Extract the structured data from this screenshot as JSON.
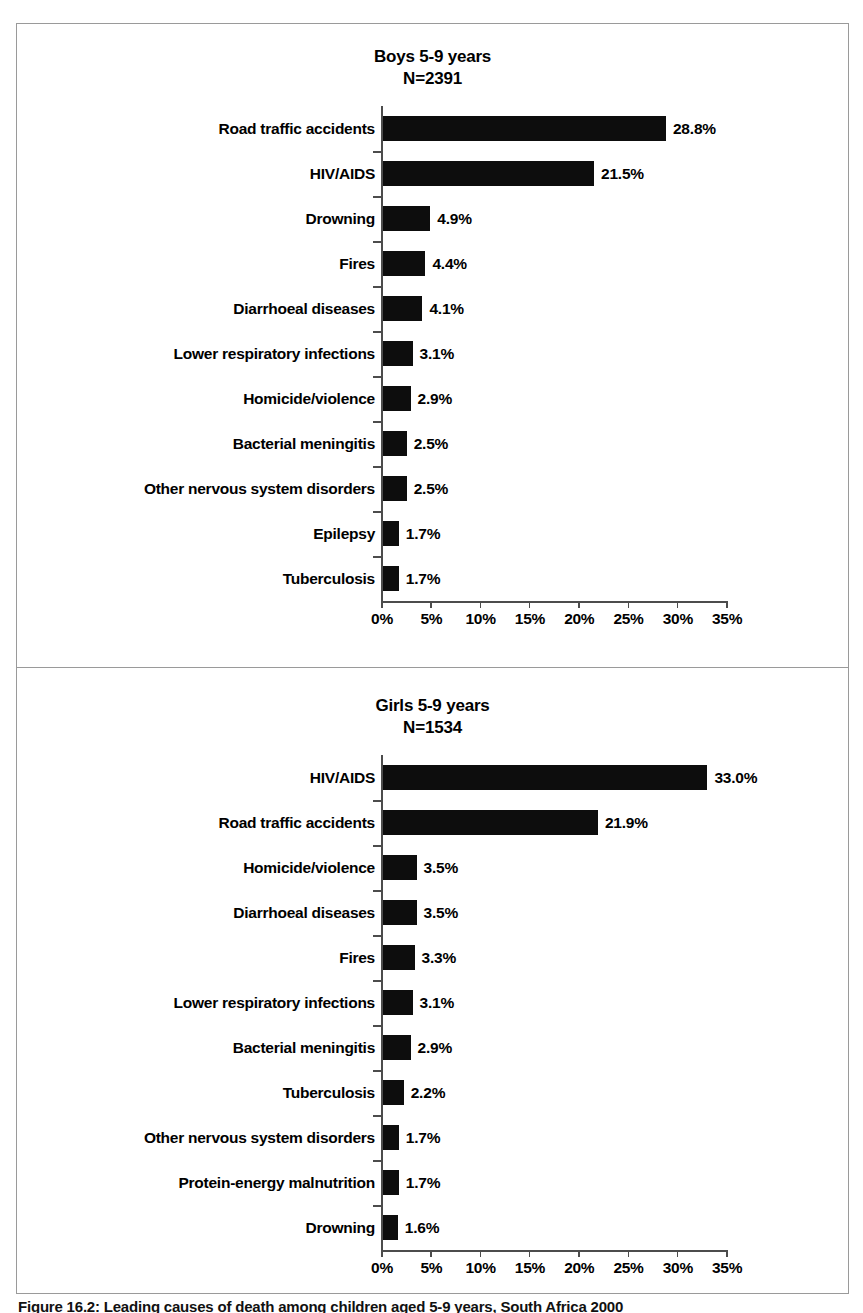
{
  "figure": {
    "caption": "Figure 16.2: Leading causes of death among children aged 5-9 years, South Africa 2000"
  },
  "panels": [
    {
      "id": "boys",
      "title": "Boys 5-9 years",
      "sample_size": "N=2391"
    },
    {
      "id": "girls",
      "title": "Girls 5-9 years",
      "sample_size": "N=1534"
    }
  ],
  "axis": {
    "ticks": [
      "0%",
      "5%",
      "10%",
      "15%",
      "20%",
      "25%",
      "30%",
      "35%"
    ]
  },
  "chart_data": [
    {
      "type": "bar",
      "orientation": "horizontal",
      "title": "Boys 5-9 years",
      "subtitle": "N=2391",
      "xlabel": "",
      "ylabel": "",
      "xlim": [
        0,
        35
      ],
      "xtick_labels": [
        "0%",
        "5%",
        "10%",
        "15%",
        "20%",
        "25%",
        "30%",
        "35%"
      ],
      "xticks": [
        0,
        5,
        10,
        15,
        20,
        25,
        30,
        35
      ],
      "grid": false,
      "legend": "none",
      "bar_color": "#0d0d0d",
      "categories": [
        "Road traffic accidents",
        "HIV/AIDS",
        "Drowning",
        "Fires",
        "Diarrhoeal diseases",
        "Lower respiratory infections",
        "Homicide/violence",
        "Bacterial meningitis",
        "Other nervous system disorders",
        "Epilepsy",
        "Tuberculosis"
      ],
      "values": [
        28.8,
        21.5,
        4.9,
        4.4,
        4.1,
        3.1,
        2.9,
        2.5,
        2.5,
        1.7,
        1.7
      ],
      "data_labels": [
        "28.8%",
        "21.5%",
        "4.9%",
        "4.4%",
        "4.1%",
        "3.1%",
        "2.9%",
        "2.5%",
        "2.5%",
        "1.7%",
        "1.7%"
      ]
    },
    {
      "type": "bar",
      "orientation": "horizontal",
      "title": "Girls 5-9 years",
      "subtitle": "N=1534",
      "xlabel": "",
      "ylabel": "",
      "xlim": [
        0,
        35
      ],
      "xtick_labels": [
        "0%",
        "5%",
        "10%",
        "15%",
        "20%",
        "25%",
        "30%",
        "35%"
      ],
      "xticks": [
        0,
        5,
        10,
        15,
        20,
        25,
        30,
        35
      ],
      "grid": false,
      "legend": "none",
      "bar_color": "#0d0d0d",
      "categories": [
        "HIV/AIDS",
        "Road traffic accidents",
        "Homicide/violence",
        "Diarrhoeal diseases",
        "Fires",
        "Lower respiratory infections",
        "Bacterial meningitis",
        "Tuberculosis",
        "Other nervous system disorders",
        "Protein-energy malnutrition",
        "Drowning"
      ],
      "values": [
        33.0,
        21.9,
        3.5,
        3.5,
        3.3,
        3.1,
        2.9,
        2.2,
        1.7,
        1.7,
        1.6
      ],
      "data_labels": [
        "33.0%",
        "21.9%",
        "3.5%",
        "3.5%",
        "3.3%",
        "3.1%",
        "2.9%",
        "2.2%",
        "1.7%",
        "1.7%",
        "1.6%"
      ]
    }
  ]
}
